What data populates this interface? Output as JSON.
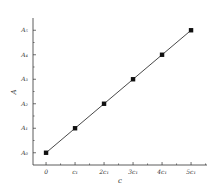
{
  "chart_data": {
    "type": "line",
    "title": "",
    "xlabel": "c",
    "ylabel": "A",
    "x_tick_labels": [
      "0",
      "c₁",
      "2c₁",
      "3c₁",
      "4c₁",
      "5c₁"
    ],
    "y_tick_labels": [
      "A₀",
      "A₁",
      "A₂",
      "A₃",
      "A₄",
      "A₅"
    ],
    "x": [
      0,
      1,
      2,
      3,
      4,
      5
    ],
    "series": [
      {
        "name": "A vs c",
        "marker": "square",
        "values": [
          0,
          1,
          2,
          3,
          4,
          5
        ]
      }
    ],
    "x_unit": "c₁",
    "y_unit": "A steps (A₀…A₅)",
    "xlim": [
      -0.45,
      5.55
    ],
    "ylim": [
      -0.5,
      5.5
    ],
    "grid": false,
    "legend": "none",
    "colors": {
      "line": "#333333",
      "marker": "#111111",
      "axis": "#333333"
    }
  }
}
